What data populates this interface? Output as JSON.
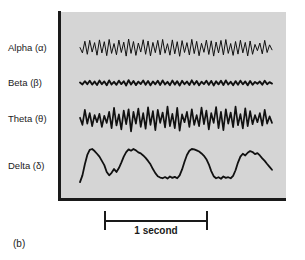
{
  "figure": {
    "caption": "(b)",
    "panel_background": "#d5d5d5",
    "trace_color": "#111111",
    "axis_color": "#1a1a1a"
  },
  "scale": {
    "label": "1 second",
    "tick_left_name": "scale-tick-left",
    "tick_right_name": "scale-tick-right"
  },
  "traces": [
    {
      "label": "Alpha (α)",
      "name": "alpha",
      "baseline_y": 48
    },
    {
      "label": "Beta (β)",
      "name": "beta",
      "baseline_y": 83
    },
    {
      "label": "Theta (θ)",
      "name": "theta",
      "baseline_y": 119
    },
    {
      "label": "Delta (δ)",
      "name": "delta",
      "baseline_y": 166
    }
  ],
  "chart_data": {
    "type": "line",
    "xlabel": "1 second",
    "ylabel": "",
    "grid": false,
    "legend": "left-labels",
    "x_start_px": 80,
    "x_end_px": 272,
    "series": [
      {
        "name": "Alpha (α)",
        "baseline_y": 48,
        "amplitude_px": 9,
        "line_width": 1.0,
        "values": [
          0.05,
          -0.55,
          0.75,
          -0.7,
          0.85,
          -0.45,
          0.6,
          -0.8,
          0.9,
          -0.55,
          0.7,
          -0.85,
          0.95,
          -0.6,
          0.5,
          -0.75,
          0.88,
          -0.5,
          0.65,
          -0.9,
          1.0,
          -0.6,
          0.72,
          -0.82,
          0.55,
          -0.45,
          0.92,
          -0.7,
          0.78,
          -0.88,
          0.62,
          -0.52,
          0.85,
          -0.75,
          0.95,
          -0.58,
          0.48,
          -0.8,
          0.9,
          -0.65,
          0.7,
          -0.92,
          0.82,
          -0.5,
          0.6,
          -0.78,
          0.96,
          -0.62,
          0.74,
          -0.86,
          0.52,
          -0.48,
          0.88,
          -0.72,
          0.8,
          -0.9,
          0.66,
          -0.55,
          0.84,
          -0.76,
          0.94,
          -0.6,
          0.5,
          -0.82,
          0.72,
          -0.68,
          0.86,
          -0.54,
          0.62,
          -0.88,
          0.78,
          -0.7,
          0.4,
          -0.3,
          0.55,
          -0.65,
          0.85,
          -0.5,
          0.35,
          -0.2
        ]
      },
      {
        "name": "Beta (β)",
        "baseline_y": 83,
        "amplitude_px": 4,
        "line_width": 1.9,
        "values": [
          0.1,
          -0.35,
          0.45,
          -0.3,
          0.55,
          -0.4,
          0.35,
          -0.5,
          0.6,
          -0.3,
          0.4,
          -0.55,
          0.65,
          -0.35,
          0.3,
          -0.45,
          0.58,
          -0.28,
          0.42,
          -0.6,
          0.7,
          -0.38,
          0.48,
          -0.52,
          0.34,
          -0.26,
          0.62,
          -0.44,
          0.5,
          -0.58,
          0.38,
          -0.32,
          0.56,
          -0.48,
          0.64,
          -0.36,
          0.28,
          -0.54,
          0.6,
          -0.4,
          0.46,
          -0.62,
          0.54,
          -0.3,
          0.36,
          -0.5,
          0.66,
          -0.38,
          0.48,
          -0.56,
          0.32,
          -0.28,
          0.58,
          -0.46,
          0.52,
          -0.6,
          0.42,
          -0.34,
          0.56,
          -0.5,
          0.64,
          -0.36,
          0.3,
          -0.54,
          0.46,
          -0.42,
          0.58,
          -0.32,
          0.4,
          -0.58,
          0.5,
          -0.44,
          0.26,
          -0.2,
          0.36,
          -0.42,
          0.56,
          -0.32,
          0.22,
          -0.14
        ]
      },
      {
        "name": "Theta (θ)",
        "baseline_y": 119,
        "amplitude_px": 13,
        "line_width": 1.7,
        "values": [
          0.1,
          -0.45,
          0.7,
          -0.35,
          0.45,
          -0.55,
          0.3,
          -0.25,
          0.4,
          -0.6,
          0.25,
          -0.3,
          0.55,
          -0.7,
          0.85,
          -0.5,
          0.35,
          -0.8,
          0.65,
          -0.4,
          0.75,
          -0.95,
          0.55,
          -0.35,
          0.8,
          -0.6,
          0.45,
          -0.75,
          0.9,
          -0.45,
          0.6,
          -0.85,
          0.7,
          -0.3,
          0.5,
          -0.65,
          0.95,
          -0.55,
          0.4,
          -0.7,
          0.85,
          -0.9,
          0.35,
          -0.25,
          0.55,
          -0.6,
          0.75,
          -0.45,
          0.3,
          -0.55,
          0.88,
          -0.4,
          0.65,
          -0.8,
          0.45,
          -0.3,
          0.92,
          -0.7,
          0.55,
          -0.85,
          0.75,
          -0.35,
          0.5,
          -0.62,
          0.95,
          -0.48,
          0.38,
          -0.72,
          0.82,
          -0.55,
          0.6,
          -0.4,
          0.3,
          -0.25,
          0.45,
          -0.5,
          0.7,
          -0.35,
          0.2,
          -0.3
        ]
      },
      {
        "name": "Delta (δ)",
        "baseline_y": 166,
        "amplitude_px": 17,
        "line_width": 1.8,
        "values": [
          -0.95,
          -0.55,
          0.1,
          0.65,
          0.95,
          1.0,
          0.88,
          0.72,
          0.55,
          0.3,
          0.05,
          -0.35,
          -0.55,
          -0.4,
          -0.18,
          -0.35,
          -0.12,
          0.2,
          0.55,
          0.82,
          0.98,
          0.9,
          1.0,
          0.92,
          0.8,
          0.74,
          0.62,
          0.48,
          0.3,
          0.1,
          -0.18,
          -0.42,
          -0.6,
          -0.68,
          -0.72,
          -0.65,
          -0.74,
          -0.62,
          -0.7,
          -0.64,
          -0.72,
          -0.55,
          -0.2,
          0.25,
          0.65,
          0.9,
          1.0,
          0.98,
          0.92,
          0.85,
          0.74,
          0.6,
          0.4,
          0.1,
          -0.3,
          -0.6,
          -0.72,
          -0.66,
          -0.75,
          -0.62,
          -0.7,
          -0.66,
          -0.72,
          -0.58,
          -0.25,
          0.2,
          0.55,
          0.72,
          0.62,
          0.78,
          0.88,
          0.82,
          0.7,
          0.76,
          0.62,
          0.45,
          0.3,
          0.12,
          -0.05,
          -0.22
        ]
      }
    ]
  }
}
